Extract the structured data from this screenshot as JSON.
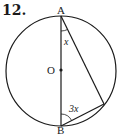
{
  "problem_number": "12.",
  "points": {
    "A": "A",
    "B": "B",
    "O": "O"
  },
  "angles": {
    "at_A": "x",
    "at_B": "3x"
  },
  "colors": {
    "stroke": "#1a1a1a",
    "background": "#ffffff"
  }
}
